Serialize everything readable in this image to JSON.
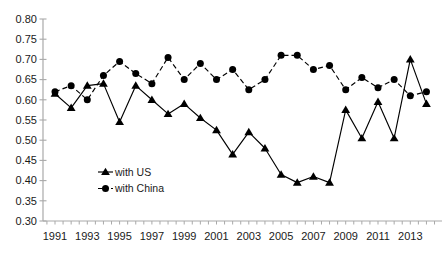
{
  "chart_data": {
    "type": "line",
    "title": "",
    "xlabel": "",
    "ylabel": "",
    "x": [
      1991,
      1992,
      1993,
      1994,
      1995,
      1996,
      1997,
      1998,
      1999,
      2000,
      2001,
      2002,
      2003,
      2004,
      2005,
      2006,
      2007,
      2008,
      2009,
      2010,
      2011,
      2012,
      2013,
      2014
    ],
    "series": [
      {
        "name": "with US",
        "marker": "triangle",
        "line_style": "solid",
        "color": "#000000",
        "values": [
          0.615,
          0.58,
          0.635,
          0.64,
          0.545,
          0.635,
          0.6,
          0.565,
          0.59,
          0.555,
          0.525,
          0.465,
          0.52,
          0.48,
          0.415,
          0.395,
          0.41,
          0.395,
          0.575,
          0.505,
          0.595,
          0.505,
          0.7,
          0.59
        ]
      },
      {
        "name": "with China",
        "marker": "circle",
        "line_style": "dashed",
        "color": "#000000",
        "values": [
          0.62,
          0.635,
          0.6,
          0.66,
          0.695,
          0.665,
          0.64,
          0.705,
          0.65,
          0.69,
          0.65,
          0.675,
          0.625,
          0.65,
          0.71,
          0.71,
          0.675,
          0.685,
          0.625,
          0.655,
          0.63,
          0.65,
          0.61,
          0.62
        ]
      }
    ],
    "ylim": [
      0.3,
      0.8
    ],
    "y_ticks": [
      0.3,
      0.35,
      0.4,
      0.45,
      0.5,
      0.55,
      0.6,
      0.65,
      0.7,
      0.75,
      0.8
    ],
    "y_tick_labels": [
      "0.30",
      "0.35",
      "0.40",
      "0.45",
      "0.50",
      "0.55",
      "0.60",
      "0.65",
      "0.70",
      "0.75",
      "0.80"
    ],
    "x_tick_labels": [
      "1991",
      "1993",
      "1995",
      "1997",
      "1999",
      "2001",
      "2003",
      "2005",
      "2007",
      "2009",
      "2011",
      "2013"
    ],
    "grid": false,
    "legend_position": "inside-bottom-left",
    "legend": [
      {
        "label": "with US"
      },
      {
        "label": "with China"
      }
    ],
    "colors": {
      "series": "#000000",
      "axis_line": "#a9a9a9",
      "tick_text": "#1a1a1a",
      "background": "#ffffff"
    }
  }
}
